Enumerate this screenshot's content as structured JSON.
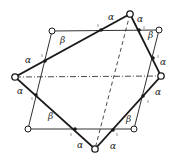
{
  "diagram": {
    "colors": {
      "stroke": "#1a1a1a",
      "background": "#ffffff"
    },
    "quadrilateral": {
      "vertices": [
        [
          130,
          14
        ],
        [
          161,
          76
        ],
        [
          95,
          149
        ],
        [
          15,
          77
        ]
      ]
    },
    "parallelogram": {
      "vertices": [
        [
          52,
          31
        ],
        [
          159,
          30
        ],
        [
          134,
          129
        ],
        [
          28,
          129
        ]
      ]
    },
    "axes": {
      "horizontal": [
        [
          15,
          77
        ],
        [
          161,
          76
        ]
      ],
      "diagonal": [
        [
          130,
          14
        ],
        [
          95,
          149
        ]
      ]
    },
    "intersections": [
      [
        101,
        30
      ],
      [
        45,
        61
      ],
      [
        139,
        30
      ],
      [
        153,
        58
      ],
      [
        143,
        96
      ],
      [
        113,
        130
      ],
      [
        75,
        129
      ],
      [
        36,
        95
      ]
    ],
    "labels": [
      {
        "text": "α",
        "x": 108,
        "y": 20
      },
      {
        "text": "β",
        "x": 60,
        "y": 43
      },
      {
        "text": "α",
        "x": 25,
        "y": 63
      },
      {
        "text": "α",
        "x": 138,
        "y": 20
      },
      {
        "text": "β",
        "x": 150,
        "y": 37
      },
      {
        "text": "α",
        "x": 160,
        "y": 64
      },
      {
        "text": "α",
        "x": 155,
        "y": 94
      },
      {
        "text": "β",
        "x": 128,
        "y": 122
      },
      {
        "text": "α",
        "x": 112,
        "y": 148
      },
      {
        "text": "α",
        "x": 78,
        "y": 148
      },
      {
        "text": "β",
        "x": 49,
        "y": 118
      },
      {
        "text": "α",
        "x": 18,
        "y": 93
      }
    ]
  }
}
